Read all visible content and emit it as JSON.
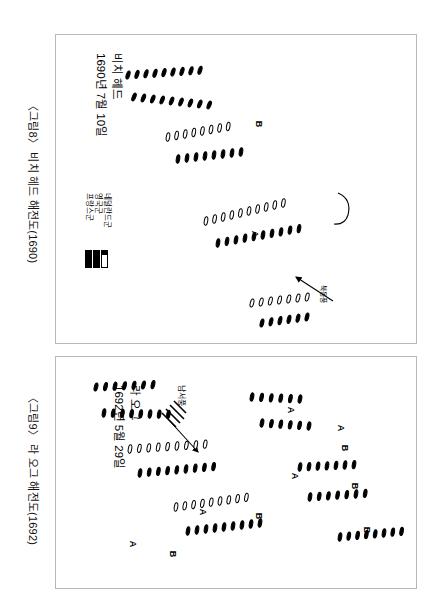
{
  "document": {
    "language": "ko",
    "figures": [
      {
        "id": "figure-8",
        "caption": "〈그림8〉 비치 헤드 해전도(1690)",
        "title": "비치 헤드",
        "date": "1690년 7월 10일",
        "wind_label": "북동풍",
        "fleet_labels": [
          "A",
          "B"
        ],
        "legend": {
          "items": [
            {
              "label": "네덜란드군",
              "swatch": "hollow-bar"
            },
            {
              "label": "영국군",
              "swatch": "solid-bar"
            },
            {
              "label": "프랑스군",
              "swatch": "solid-bar"
            }
          ]
        }
      },
      {
        "id": "figure-9",
        "caption": "〈그림9〉 라 오그 해전도(1692)",
        "title": "라 오그",
        "date": "1692년 5월 29일",
        "wind_label": "남서풍",
        "fleet_labels": [
          "A",
          "B"
        ]
      }
    ]
  },
  "chart_data": {
    "type": "diagram",
    "orientation": "page rotated 90 degrees clockwise; all text reads bottom-to-top",
    "panels": [
      {
        "name": "비치 헤드",
        "date": "1690년 7월 10일",
        "wind": "북동풍",
        "formation_markers": [
          "A",
          "B"
        ],
        "legend_entries": [
          "네덜란드군",
          "영국군",
          "프랑스군"
        ],
        "ship_line_count": 6
      },
      {
        "name": "라 오그",
        "date": "1692년 5월 29일",
        "wind": "남서풍",
        "formation_markers": [
          "A",
          "A",
          "A",
          "A",
          "B",
          "B",
          "B",
          "B"
        ],
        "ship_line_count": 8
      }
    ]
  }
}
